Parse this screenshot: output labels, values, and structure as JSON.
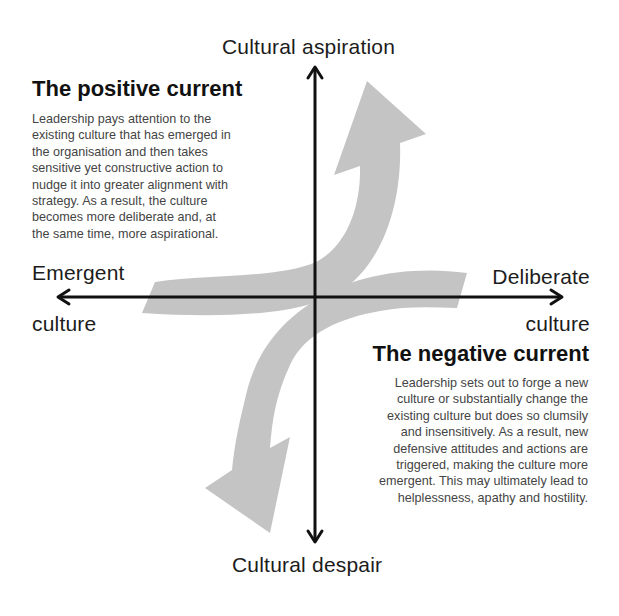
{
  "axes": {
    "top": "Cultural aspiration",
    "bottom": "Cultural despair",
    "left_line1": "Emergent",
    "left_line2": "culture",
    "right_line1": "Deliberate",
    "right_line2": "culture"
  },
  "positive_current": {
    "title": "The positive current",
    "lines": [
      "Leadership pays attention to the",
      "existing culture that has emerged in",
      "the organisation and then takes",
      "sensitive yet constructive action to",
      "nudge it into greater alignment with",
      "strategy. As a result, the culture",
      "becomes more deliberate and, at",
      "the same time, more aspirational."
    ]
  },
  "negative_current": {
    "title": "The negative current",
    "lines": [
      "Leadership sets out to forge a new",
      "culture or substantially change the",
      "existing culture but does so clumsily",
      "and insensitively. As a result, new",
      "defensive attitudes and actions are",
      "triggered, making the culture more",
      "emergent. This may ultimately lead to",
      "helplessness, apathy and hostility."
    ]
  },
  "colors": {
    "arrow_fill": "#c4c4c4",
    "axis": "#111111",
    "body_text": "#444444",
    "heading": "#111111"
  }
}
